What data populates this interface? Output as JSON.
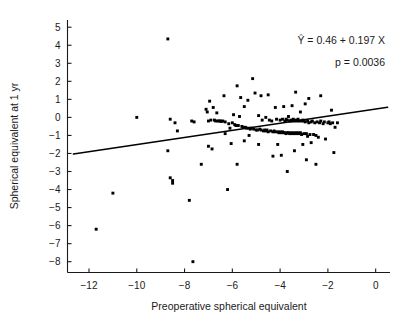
{
  "chart_data": {
    "type": "scatter",
    "title": "",
    "xlabel": "Preoperative spherical equivalent",
    "ylabel": "Spherical equivalent at 1 yr",
    "xlim": [
      -12.9,
      0.6
    ],
    "ylim": [
      -8.6,
      5.4
    ],
    "xticks": [
      -12,
      -10,
      -8,
      -6,
      -4,
      -2,
      0
    ],
    "xtick_labels": [
      "−12",
      "−10",
      "−8",
      "−6",
      "−4",
      "−2",
      "0"
    ],
    "yticks": [
      5,
      4,
      3,
      2,
      1,
      0,
      -1,
      -2,
      -3,
      -4,
      -5,
      -6,
      -7,
      -8
    ],
    "ytick_labels": [
      "5",
      "4",
      "3",
      "2",
      "1",
      "0",
      "−1",
      "−2",
      "−3",
      "−4",
      "−5",
      "−6",
      "−7",
      "−8"
    ],
    "grid": false,
    "legend": false,
    "marker": "filled-square",
    "marker_color": "#000000",
    "point_count": 166,
    "points": [
      [
        -11.7,
        -6.2
      ],
      [
        -11.0,
        -4.2
      ],
      [
        -10.0,
        0.0
      ],
      [
        -8.7,
        4.35
      ],
      [
        -8.7,
        -1.85
      ],
      [
        -8.6,
        -0.1
      ],
      [
        -8.6,
        -3.35
      ],
      [
        -8.5,
        -3.5
      ],
      [
        -8.5,
        -3.65
      ],
      [
        -8.4,
        -0.3
      ],
      [
        -8.3,
        -0.75
      ],
      [
        -7.8,
        -4.6
      ],
      [
        -7.7,
        -0.2
      ],
      [
        -7.65,
        -8.0
      ],
      [
        -7.6,
        -0.25
      ],
      [
        -7.3,
        -2.6
      ],
      [
        -7.1,
        0.45
      ],
      [
        -7.05,
        0.3
      ],
      [
        -7.0,
        -0.2
      ],
      [
        -7.0,
        -1.6
      ],
      [
        -6.95,
        0.9
      ],
      [
        -6.9,
        -0.15
      ],
      [
        -6.85,
        -1.75
      ],
      [
        -6.8,
        0.55
      ],
      [
        -6.75,
        -0.15
      ],
      [
        -6.7,
        -0.2
      ],
      [
        -6.65,
        0.25
      ],
      [
        -6.6,
        -0.2
      ],
      [
        -6.55,
        -0.2
      ],
      [
        -6.5,
        -0.2
      ],
      [
        -6.45,
        -0.22
      ],
      [
        -6.4,
        -0.2
      ],
      [
        -6.35,
        1.2
      ],
      [
        -6.3,
        -0.25
      ],
      [
        -6.3,
        -0.9
      ],
      [
        -6.2,
        -4.0
      ],
      [
        -6.15,
        -0.35
      ],
      [
        -6.1,
        -0.6
      ],
      [
        -6.05,
        -1.45
      ],
      [
        -6.0,
        -0.3
      ],
      [
        -5.95,
        0.15
      ],
      [
        -5.9,
        -0.4
      ],
      [
        -5.85,
        -0.45
      ],
      [
        -5.8,
        1.75
      ],
      [
        -5.8,
        -2.6
      ],
      [
        -5.75,
        -0.45
      ],
      [
        -5.7,
        0.05
      ],
      [
        -5.65,
        1.1
      ],
      [
        -5.6,
        -0.5
      ],
      [
        -5.55,
        -0.55
      ],
      [
        -5.5,
        0.6
      ],
      [
        -5.5,
        -1.3
      ],
      [
        -5.45,
        -0.55
      ],
      [
        -5.4,
        -0.6
      ],
      [
        -5.35,
        0.95
      ],
      [
        -5.3,
        -0.6
      ],
      [
        -5.3,
        -1.0
      ],
      [
        -5.25,
        -0.65
      ],
      [
        -5.2,
        -0.6
      ],
      [
        -5.15,
        2.15
      ],
      [
        -5.1,
        -0.65
      ],
      [
        -5.05,
        1.35
      ],
      [
        -5.0,
        -0.7
      ],
      [
        -4.95,
        -0.7
      ],
      [
        -4.9,
        0.1
      ],
      [
        -4.9,
        -1.5
      ],
      [
        -4.85,
        -0.65
      ],
      [
        -4.8,
        1.2
      ],
      [
        -4.8,
        -0.7
      ],
      [
        -4.75,
        -0.15
      ],
      [
        -4.7,
        -0.75
      ],
      [
        -4.65,
        -0.7
      ],
      [
        -4.6,
        0.0
      ],
      [
        -4.6,
        -0.75
      ],
      [
        -4.55,
        -0.7
      ],
      [
        -4.5,
        1.25
      ],
      [
        -4.5,
        -0.8
      ],
      [
        -4.45,
        -0.15
      ],
      [
        -4.4,
        -0.75
      ],
      [
        -4.35,
        -0.2
      ],
      [
        -4.3,
        -0.8
      ],
      [
        -4.3,
        -2.15
      ],
      [
        -4.25,
        -0.75
      ],
      [
        -4.2,
        0.55
      ],
      [
        -4.2,
        -0.8
      ],
      [
        -4.15,
        -0.1
      ],
      [
        -4.1,
        -0.8
      ],
      [
        -4.1,
        -1.5
      ],
      [
        -4.05,
        -0.85
      ],
      [
        -4.0,
        -0.15
      ],
      [
        -4.0,
        -0.8
      ],
      [
        -3.95,
        -0.85
      ],
      [
        -3.95,
        -2.1
      ],
      [
        -3.9,
        -0.1
      ],
      [
        -3.9,
        -0.8
      ],
      [
        -3.85,
        0.6
      ],
      [
        -3.85,
        -0.85
      ],
      [
        -3.8,
        -0.2
      ],
      [
        -3.8,
        -0.85
      ],
      [
        -3.75,
        -0.1
      ],
      [
        -3.75,
        -0.9
      ],
      [
        -3.7,
        -0.15
      ],
      [
        -3.7,
        -0.85
      ],
      [
        -3.7,
        -3.0
      ],
      [
        -3.65,
        0.05
      ],
      [
        -3.65,
        -0.85
      ],
      [
        -3.6,
        -0.2
      ],
      [
        -3.6,
        -0.9
      ],
      [
        -3.55,
        -0.15
      ],
      [
        -3.55,
        -0.85
      ],
      [
        -3.5,
        0.65
      ],
      [
        -3.5,
        -0.2
      ],
      [
        -3.5,
        -0.9
      ],
      [
        -3.45,
        -0.1
      ],
      [
        -3.45,
        -0.85
      ],
      [
        -3.4,
        -0.2
      ],
      [
        -3.4,
        -0.9
      ],
      [
        -3.4,
        -1.85
      ],
      [
        -3.35,
        1.4
      ],
      [
        -3.35,
        -0.15
      ],
      [
        -3.35,
        -0.85
      ],
      [
        -3.3,
        -0.2
      ],
      [
        -3.3,
        -0.9
      ],
      [
        -3.25,
        -0.1
      ],
      [
        -3.25,
        -0.85
      ],
      [
        -3.2,
        -0.2
      ],
      [
        -3.2,
        -0.9
      ],
      [
        -3.15,
        0.3
      ],
      [
        -3.15,
        -0.85
      ],
      [
        -3.1,
        -0.2
      ],
      [
        -3.1,
        -0.95
      ],
      [
        -3.05,
        -0.15
      ],
      [
        -3.05,
        -1.5
      ],
      [
        -3.0,
        -0.2
      ],
      [
        -3.0,
        -0.9
      ],
      [
        -2.95,
        0.75
      ],
      [
        -2.95,
        -0.25
      ],
      [
        -2.9,
        -0.9
      ],
      [
        -2.9,
        -2.35
      ],
      [
        -2.85,
        -0.2
      ],
      [
        -2.85,
        -1.05
      ],
      [
        -2.8,
        1.05
      ],
      [
        -2.8,
        -0.3
      ],
      [
        -2.75,
        -0.95
      ],
      [
        -2.7,
        -0.25
      ],
      [
        -2.7,
        -1.4
      ],
      [
        -2.65,
        -0.2
      ],
      [
        -2.6,
        -0.95
      ],
      [
        -2.55,
        -0.3
      ],
      [
        -2.5,
        -1.0
      ],
      [
        -2.5,
        -2.6
      ],
      [
        -2.45,
        -0.25
      ],
      [
        -2.4,
        -1.1
      ],
      [
        -2.35,
        -0.3
      ],
      [
        -2.3,
        1.2
      ],
      [
        -2.3,
        -0.2
      ],
      [
        -2.2,
        -0.35
      ],
      [
        -2.15,
        -0.25
      ],
      [
        -2.1,
        -1.2
      ],
      [
        -2.0,
        -0.3
      ],
      [
        -1.95,
        -0.25
      ],
      [
        -1.9,
        -0.35
      ],
      [
        -1.85,
        0.4
      ],
      [
        -1.8,
        -0.3
      ],
      [
        -1.75,
        -1.95
      ],
      [
        -1.7,
        -0.55
      ],
      [
        -1.6,
        -0.3
      ]
    ],
    "fit_line": {
      "label": "regression-line",
      "intercept": 0.46,
      "slope": 0.197,
      "x_start": -12.65,
      "x_end": 0.5
    },
    "annotations": {
      "equation": "Ŷ = 0.46 + 0.197 X",
      "pvalue": "p = 0.0036"
    }
  }
}
